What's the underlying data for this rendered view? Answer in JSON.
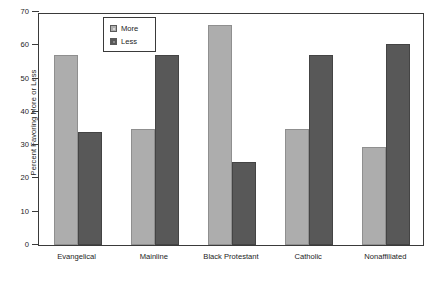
{
  "chart_data": {
    "type": "bar",
    "title": "",
    "xlabel": "",
    "ylabel": "Percent Favoring More or Less",
    "categories": [
      "Evangelical",
      "Mainline",
      "Black Protestant",
      "Catholic",
      "Nonaffiliated"
    ],
    "series": [
      {
        "name": "More",
        "color": "#adadad",
        "values": [
          57,
          35,
          66,
          35,
          29.5
        ]
      },
      {
        "name": "Less",
        "color": "#585858",
        "values": [
          34,
          57,
          25,
          57,
          60.5
        ]
      }
    ],
    "ylim": [
      0,
      70
    ],
    "yticks": [
      0,
      10,
      20,
      30,
      40,
      50,
      60,
      70
    ],
    "ytick_labels": [
      "0",
      "10",
      "20",
      "30",
      "40",
      "50",
      "60",
      "70"
    ],
    "grid": false,
    "legend_position": "top-left-inside",
    "legend_entries": [
      "More",
      "Less"
    ]
  }
}
